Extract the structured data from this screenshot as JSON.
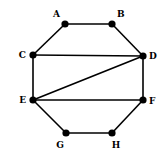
{
  "diagram": {
    "type": "undirected-graph",
    "colors": {
      "edge": "#000000",
      "node": "#000000",
      "label": "#000000",
      "background": "#ffffff"
    },
    "nodes": [
      {
        "id": "A",
        "label": "A",
        "x": 65,
        "y": 24,
        "lx": 60,
        "ly": 17,
        "anchor": "end"
      },
      {
        "id": "B",
        "label": "B",
        "x": 112,
        "y": 24,
        "lx": 117,
        "ly": 17,
        "anchor": "start"
      },
      {
        "id": "C",
        "label": "C",
        "x": 33,
        "y": 55,
        "lx": 26,
        "ly": 58,
        "anchor": "end"
      },
      {
        "id": "D",
        "label": "D",
        "x": 143,
        "y": 56,
        "lx": 149,
        "ly": 59,
        "anchor": "start"
      },
      {
        "id": "E",
        "label": "E",
        "x": 33,
        "y": 100,
        "lx": 26,
        "ly": 103,
        "anchor": "end"
      },
      {
        "id": "F",
        "label": "F",
        "x": 143,
        "y": 100,
        "lx": 149,
        "ly": 104,
        "anchor": "start"
      },
      {
        "id": "G",
        "label": "G",
        "x": 66,
        "y": 133,
        "lx": 60,
        "ly": 148,
        "anchor": "middle"
      },
      {
        "id": "H",
        "label": "H",
        "x": 112,
        "y": 133,
        "lx": 116,
        "ly": 148,
        "anchor": "middle"
      }
    ],
    "edges": [
      [
        "A",
        "B"
      ],
      [
        "A",
        "C"
      ],
      [
        "B",
        "D"
      ],
      [
        "C",
        "D"
      ],
      [
        "C",
        "E"
      ],
      [
        "D",
        "E"
      ],
      [
        "D",
        "F"
      ],
      [
        "E",
        "F"
      ],
      [
        "E",
        "G"
      ],
      [
        "F",
        "H"
      ],
      [
        "G",
        "H"
      ]
    ]
  }
}
